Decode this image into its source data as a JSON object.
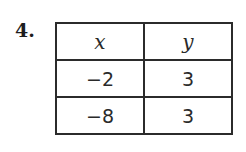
{
  "problem": {
    "number": "4."
  },
  "table": {
    "headers": [
      "x",
      "y"
    ],
    "rows": [
      [
        "−2",
        "3"
      ],
      [
        "−8",
        "3"
      ]
    ]
  }
}
